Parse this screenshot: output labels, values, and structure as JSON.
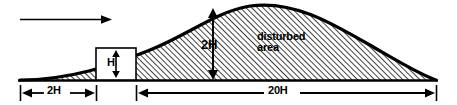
{
  "diagram": {
    "labels": {
      "flow_arrow": "flow-direction-arrow",
      "height_vertical": "2H",
      "disturbed_area_line1": "disturbed",
      "disturbed_area_line2": "area",
      "building_height": "H",
      "upwind_distance": "2H",
      "downwind_distance": "20H"
    },
    "colors": {
      "outline": "#000000",
      "hatch": "#1a1a1a",
      "background": "#ffffff",
      "box_fill": "#ffffff"
    },
    "geometry": {
      "baseline_y": 80,
      "crest_y": 5,
      "hill_left_x": 20,
      "hill_right_x": 436,
      "box_left_x": 96,
      "box_right_x": 136,
      "box_top_y": 48,
      "dimension_line_y": 93
    }
  }
}
